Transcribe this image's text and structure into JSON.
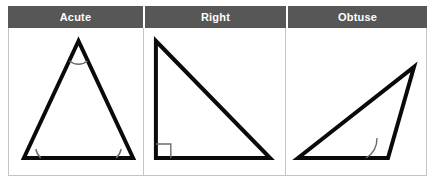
{
  "table": {
    "columns": [
      {
        "header": "Acute",
        "shape_name": "acute-triangle",
        "angle_markers": 3
      },
      {
        "header": "Right",
        "shape_name": "right-triangle",
        "angle_markers": 1
      },
      {
        "header": "Obtuse",
        "shape_name": "obtuse-triangle",
        "angle_markers": 1
      }
    ]
  },
  "colors": {
    "header_background": "#575757",
    "header_text": "#ffffff",
    "cell_background": "#ffffff",
    "grid_border": "#c4c4c4",
    "shape_stroke": "#0a0a0a",
    "angle_mark_stroke": "#6b6b6b"
  }
}
